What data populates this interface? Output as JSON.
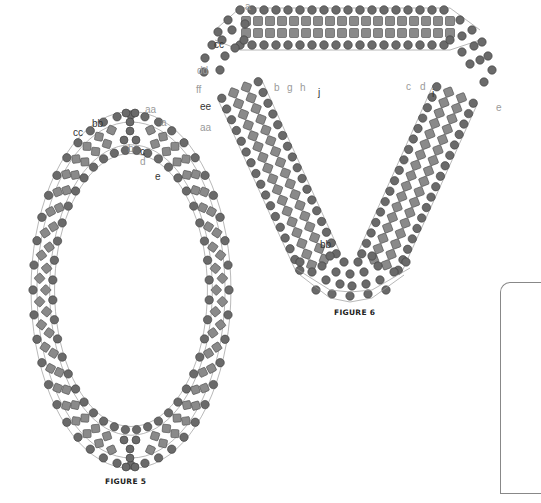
{
  "colors": {
    "round_bead": "#6a6a6a",
    "round_bead_stroke": "#3a3a3a",
    "cube_bead": "#8a8a8a",
    "cube_bead_stroke": "#4a4a4a",
    "thread": "#9a9a9a",
    "label_dark": "#333333",
    "label_light": "#9a9a9a",
    "caption": "#222222"
  },
  "figures": [
    {
      "id": "figure-5",
      "caption": "FIGURE 5",
      "shape": "oval",
      "labels": [
        {
          "text": "aa",
          "tone": "light"
        },
        {
          "text": "bb",
          "tone": "dark"
        },
        {
          "text": "a",
          "tone": "light"
        },
        {
          "text": "cc",
          "tone": "dark"
        },
        {
          "text": "b",
          "tone": "light"
        },
        {
          "text": "c",
          "tone": "dark"
        },
        {
          "text": "d",
          "tone": "light"
        },
        {
          "text": "e",
          "tone": "dark"
        }
      ]
    },
    {
      "id": "figure-6",
      "caption": "FIGURE 6",
      "shape": "triangle",
      "labels": [
        {
          "text": "a",
          "tone": "light"
        },
        {
          "text": "cc",
          "tone": "dark"
        },
        {
          "text": "dd",
          "tone": "light"
        },
        {
          "text": "ff",
          "tone": "light"
        },
        {
          "text": "ee",
          "tone": "dark"
        },
        {
          "text": "aa",
          "tone": "light"
        },
        {
          "text": "b",
          "tone": "light"
        },
        {
          "text": "g",
          "tone": "light"
        },
        {
          "text": "h",
          "tone": "light"
        },
        {
          "text": "j",
          "tone": "dark"
        },
        {
          "text": "c",
          "tone": "light"
        },
        {
          "text": "d",
          "tone": "light"
        },
        {
          "text": "i",
          "tone": "dark"
        },
        {
          "text": "e",
          "tone": "light"
        },
        {
          "text": "bb",
          "tone": "dark"
        }
      ]
    }
  ]
}
